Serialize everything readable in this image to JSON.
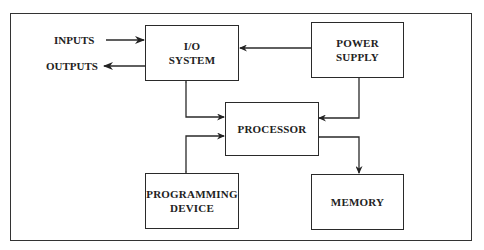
{
  "diagram": {
    "title": "",
    "blocks": {
      "io_system": {
        "line1": "I/O",
        "line2": "SYSTEM"
      },
      "power_supply": {
        "line1": "POWER",
        "line2": "SUPPLY"
      },
      "processor": {
        "line1": "PROCESSOR"
      },
      "programming_device": {
        "line1": "PROGRAMMING",
        "line2": "DEVICE"
      },
      "memory": {
        "line1": "MEMORY"
      }
    },
    "external_labels": {
      "inputs": "INPUTS",
      "outputs": "OUTPUTS"
    },
    "connections": [
      {
        "from": "INPUTS",
        "to": "I/O SYSTEM",
        "direction": "one-way"
      },
      {
        "from": "I/O SYSTEM",
        "to": "OUTPUTS",
        "direction": "one-way"
      },
      {
        "from": "POWER SUPPLY",
        "to": "I/O SYSTEM",
        "direction": "one-way"
      },
      {
        "from": "POWER SUPPLY",
        "to": "PROCESSOR",
        "direction": "one-way"
      },
      {
        "from": "I/O SYSTEM",
        "to": "PROCESSOR",
        "direction": "two-way"
      },
      {
        "from": "PROGRAMMING DEVICE",
        "to": "PROCESSOR",
        "direction": "two-way"
      },
      {
        "from": "MEMORY",
        "to": "PROCESSOR",
        "direction": "two-way"
      }
    ],
    "colors": {
      "line": "#2a2a2a",
      "background": "#ffffff",
      "text": "#222222"
    }
  }
}
